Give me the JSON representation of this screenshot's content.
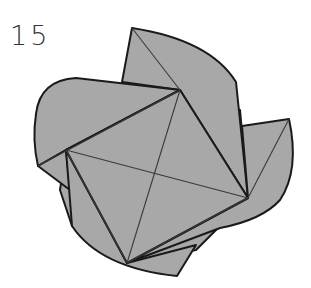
{
  "diagram": {
    "step_number": "15",
    "colors": {
      "paper_fill": "#a8a8a8",
      "outline": "#1a1a1a",
      "crease": "#3a3a3a",
      "background": "#ffffff"
    },
    "vertices": {
      "top": [
        180,
        90
      ],
      "left": [
        66,
        150
      ],
      "right": [
        248,
        198
      ],
      "bottom": [
        127,
        263
      ]
    },
    "flaps": [
      "top-flap",
      "left-flap",
      "right-flap",
      "bottom-flap"
    ]
  }
}
